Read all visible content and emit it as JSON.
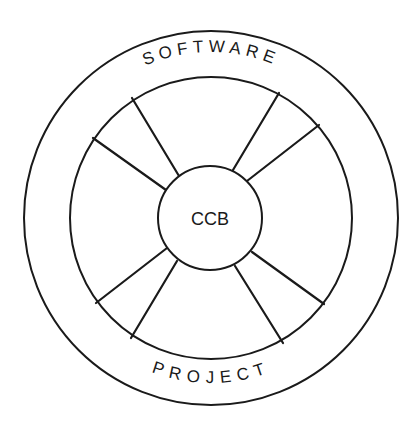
{
  "diagram": {
    "type": "concentric-wheel",
    "outer_label_top": "SOFTWARE",
    "outer_label_bottom": "PROJECT",
    "hub_label": "CCB",
    "center": [
      211,
      218
    ],
    "radii": {
      "outer": 187,
      "middle": 141,
      "hub": 52
    },
    "spoke_count": 8,
    "spokes": [
      {
        "name": "spoke-upper-left",
        "outer": [
          132,
          98
        ],
        "inner": [
          179,
          176
        ]
      },
      {
        "name": "spoke-left-upper",
        "outer": [
          93,
          138
        ],
        "inner": [
          166,
          190
        ]
      },
      {
        "name": "spoke-left-lower",
        "outer": [
          96,
          303
        ],
        "inner": [
          167,
          248
        ]
      },
      {
        "name": "spoke-lower-left",
        "outer": [
          131,
          338
        ],
        "inner": [
          177,
          261
        ]
      },
      {
        "name": "spoke-lower-right",
        "outer": [
          283,
          343
        ],
        "inner": [
          235,
          266
        ]
      },
      {
        "name": "spoke-right-lower",
        "outer": [
          324,
          304
        ],
        "inner": [
          252,
          252
        ]
      },
      {
        "name": "spoke-right-upper",
        "outer": [
          319,
          125
        ],
        "inner": [
          247,
          181
        ]
      },
      {
        "name": "spoke-upper-right",
        "outer": [
          279,
          93
        ],
        "inner": [
          233,
          170
        ]
      }
    ],
    "line_color": "#1a1a1a",
    "background": "#ffffff"
  }
}
